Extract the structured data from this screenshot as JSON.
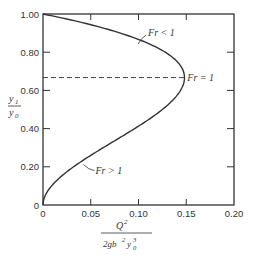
{
  "chart_data": {
    "type": "line",
    "title": "",
    "xlabel": "Q^2 / (2 g b^2 y0^3)",
    "ylabel": "y1 / y0",
    "xlim": [
      0,
      0.2
    ],
    "ylim": [
      0,
      1.0
    ],
    "x_ticks": [
      "0",
      "0.05",
      "0.10",
      "0.15",
      "0.20"
    ],
    "y_ticks": [
      "0",
      "0.20",
      "0.40",
      "0.60",
      "0.80",
      "1.00"
    ],
    "grid": false,
    "series": [
      {
        "name": "y^2(1-y) curve",
        "relation": "x = y^2 (1 - y)",
        "points": [
          [
            0,
            0
          ],
          [
            0.0095,
            0.1
          ],
          [
            0.032,
            0.2
          ],
          [
            0.063,
            0.3
          ],
          [
            0.096,
            0.4
          ],
          [
            0.125,
            0.5
          ],
          [
            0.144,
            0.6
          ],
          [
            0.148,
            0.667
          ],
          [
            0.147,
            0.7
          ],
          [
            0.128,
            0.8
          ],
          [
            0.081,
            0.9
          ],
          [
            0,
            1.0
          ]
        ]
      },
      {
        "name": "Fr = 1 critical line",
        "style": "dashed",
        "points": [
          [
            0,
            0.667
          ],
          [
            0.148,
            0.667
          ]
        ]
      }
    ],
    "annotations": [
      {
        "text": "Fr < 1",
        "x": 0.11,
        "y": 0.9
      },
      {
        "text": "Fr = 1",
        "x": 0.152,
        "y": 0.667
      },
      {
        "text": "Fr > 1",
        "x": 0.055,
        "y": 0.18
      }
    ]
  },
  "labels": {
    "y_num": "y",
    "y_num_sub": "1",
    "y_den": "y",
    "y_den_sub": "0",
    "x_num": "Q",
    "x_num_sup": "2",
    "x_den": "2gb",
    "x_den_sup": "2",
    "x_den_y": "y",
    "x_den_y_sup": "3",
    "x_den_y_sub": "0",
    "ann_sub": "Fr < 1",
    "ann_crit": "Fr = 1",
    "ann_super": "Fr > 1"
  }
}
